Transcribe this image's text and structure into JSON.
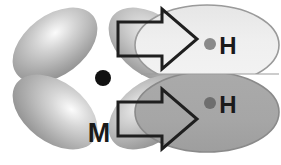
{
  "figure": {
    "background_color": "#ffffff",
    "width": 281,
    "height": 165
  },
  "metal": {
    "label": "M",
    "label_x": 99,
    "label_y": 142,
    "center_x": 103,
    "center_y": 78,
    "nucleus_radius": 8,
    "nucleus_color": "#111111",
    "orbital_name": "d-orbital",
    "lobe_fill_light": "#f2f2f2",
    "lobe_fill_mid": "#b8b8b8",
    "lobe_fill_dark": "#8f8f8f",
    "lobes": [
      {
        "name": "upper-left-lobe",
        "cx": 55,
        "cy": 45,
        "rx": 48,
        "ry": 30,
        "rotate": -37
      },
      {
        "name": "lower-left-lobe",
        "cx": 55,
        "cy": 112,
        "rx": 48,
        "ry": 30,
        "rotate": 37
      },
      {
        "name": "upper-right-lobe",
        "cx": 151,
        "cy": 45,
        "rx": 48,
        "ry": 30,
        "rotate": 37
      },
      {
        "name": "lower-right-lobe",
        "cx": 151,
        "cy": 112,
        "rx": 48,
        "ry": 30,
        "rotate": -37
      }
    ]
  },
  "hydrogen": {
    "orbital_name": "sigma-orbital",
    "top": {
      "label": "H",
      "label_x": 228,
      "label_y": 52,
      "nucleus_x": 210,
      "nucleus_y": 44,
      "nucleus_radius": 6,
      "nucleus_color": "#8a8a8a",
      "cx": 207,
      "cy": 45,
      "rx": 72,
      "ry": 40,
      "fill": "#ececec",
      "stroke": "#9a9a9a"
    },
    "bottom": {
      "label": "H",
      "label_x": 228,
      "label_y": 111,
      "nucleus_x": 210,
      "nucleus_y": 103,
      "nucleus_radius": 6,
      "nucleus_color": "#6e6e6e",
      "cx": 207,
      "cy": 112,
      "rx": 72,
      "ry": 40,
      "fill": "#a9a9a9",
      "stroke": "#8a8a8a"
    }
  },
  "arrows": [
    {
      "name": "top-donation-arrow",
      "direction": "right",
      "stroke": "#1f1f1f",
      "stroke_width": 3,
      "fill": "none",
      "points": "118,22 162,22 162,9 197,39 162,69 162,56 118,56"
    },
    {
      "name": "bottom-donation-arrow",
      "direction": "right",
      "stroke": "#1f1f1f",
      "stroke_width": 3,
      "fill": "none",
      "points": "118,102 162,102 162,89 197,119 162,149 162,136 118,136"
    }
  ]
}
